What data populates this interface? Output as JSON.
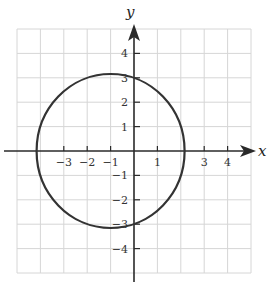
{
  "figure": {
    "x_axis_label": "x",
    "y_axis_label": "y",
    "x_range": [
      -5,
      5
    ],
    "y_range": [
      -5,
      5
    ],
    "x_tick_labels": [
      "-3",
      "-2",
      "-1",
      "1",
      "3",
      "4"
    ],
    "y_tick_labels": [
      "4",
      "3",
      "2",
      "1",
      "-1",
      "-2",
      "-3",
      "-4"
    ],
    "curve": {
      "type": "circle",
      "center": [
        -1,
        0
      ],
      "radius": 3.16,
      "passes_through": [
        [
          0,
          3
        ],
        [
          0,
          -3
        ],
        [
          -4.16,
          0
        ],
        [
          2.16,
          0
        ]
      ]
    },
    "colors": {
      "grid": "#d6d6d6",
      "axis": "#2a2a2a",
      "curve": "#333333"
    }
  },
  "labels": {
    "x": "x",
    "y": "y",
    "xt_m3": "−3",
    "xt_m2": "−2",
    "xt_m1": "−1",
    "xt_1": "1",
    "xt_3": "3",
    "xt_4": "4",
    "yt_4": "4",
    "yt_3": "3",
    "yt_2": "2",
    "yt_1": "1",
    "yt_m1": "−1",
    "yt_m2": "−2",
    "yt_m3": "−3",
    "yt_m4": "−4"
  }
}
